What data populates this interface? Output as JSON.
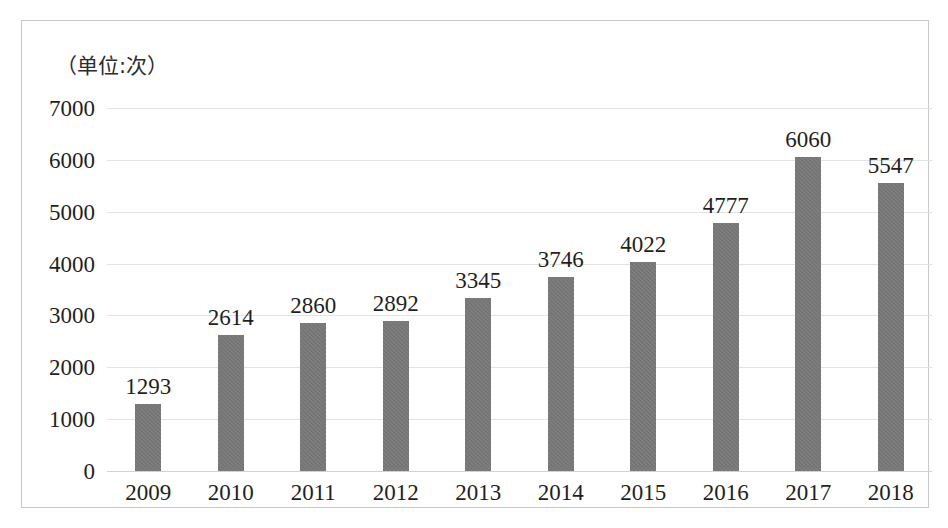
{
  "figure": {
    "unit_label": "（单位:次）",
    "border_color": "#c9c9c9",
    "background_color": "#ffffff"
  },
  "chart_data": {
    "type": "bar",
    "title": "",
    "subtitle": "",
    "xlabel": "",
    "ylabel": "（单位:次）",
    "categories": [
      "2009",
      "2010",
      "2011",
      "2012",
      "2013",
      "2014",
      "2015",
      "2016",
      "2017",
      "2018"
    ],
    "values": [
      1293,
      2614,
      2860,
      2892,
      3345,
      3746,
      4022,
      4777,
      6060,
      5547
    ],
    "data_labels": [
      "1293",
      "2614",
      "2860",
      "2892",
      "3345",
      "3746",
      "4022",
      "4777",
      "6060",
      "5547"
    ],
    "ylim": [
      0,
      7000
    ],
    "ytick_values": [
      0,
      1000,
      2000,
      3000,
      4000,
      5000,
      6000,
      7000
    ],
    "ytick_labels": [
      "0",
      "1000",
      "2000",
      "3000",
      "4000",
      "5000",
      "6000",
      "7000"
    ],
    "grid": true,
    "legend": false,
    "legend_position": "none",
    "series": [
      {
        "name": "次数",
        "color": "#757575",
        "values": [
          1293,
          2614,
          2860,
          2892,
          3345,
          3746,
          4022,
          4777,
          6060,
          5547
        ]
      }
    ],
    "bar_color": "#757575",
    "gridline_color": "#e3e3e3",
    "axis_color": "#d2d2d2"
  }
}
